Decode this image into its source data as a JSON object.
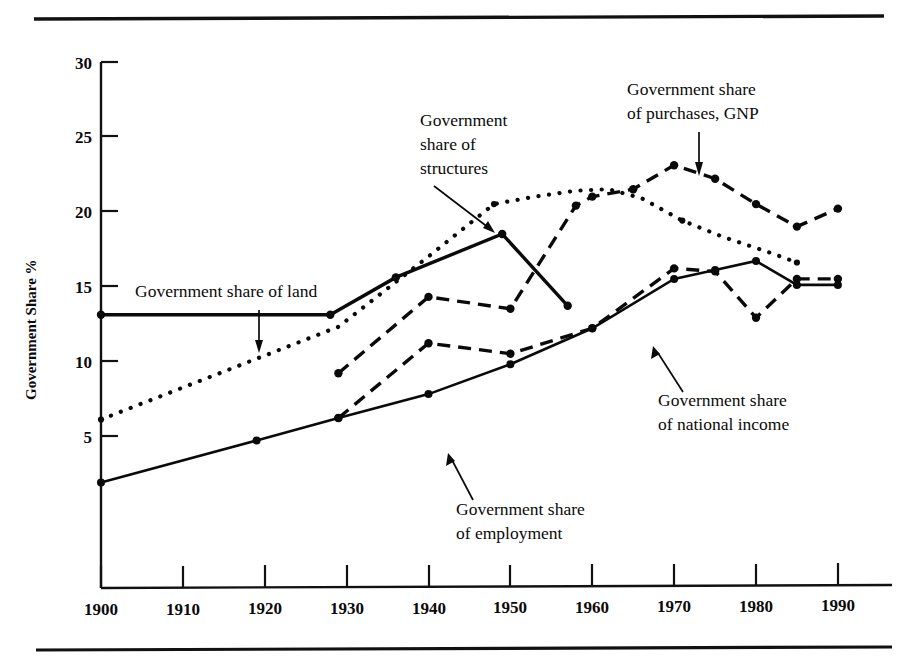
{
  "figure": {
    "top_rule": true,
    "bottom_rule": true,
    "background": "#ffffff",
    "ink": "#0a0a0a"
  },
  "chart_data": {
    "type": "line",
    "title": "",
    "xlabel": "",
    "ylabel": "Government Share %",
    "xlim": [
      1900,
      1990
    ],
    "ylim": [
      0,
      30
    ],
    "grid": false,
    "legend_position": "inline-annotations",
    "x_ticks": [
      "1900",
      "1910",
      "1920",
      "1930",
      "1940",
      "1950",
      "1960",
      "1970",
      "1980",
      "1990"
    ],
    "y_ticks": [
      "5",
      "10",
      "15",
      "20",
      "25",
      "30"
    ],
    "series": [
      {
        "name": "Government share of land",
        "style": "solid",
        "x": [
          1900,
          1928,
          1936,
          1949,
          1957
        ],
        "values": [
          13.1,
          13.1,
          15.6,
          18.5,
          13.7
        ]
      },
      {
        "name": "Government share of structures",
        "style": "dotted",
        "x": [
          1900,
          1929,
          1940,
          1948,
          1953,
          1958,
          1962,
          1966,
          1971,
          1976,
          1982,
          1985
        ],
        "values": [
          6.1,
          12.3,
          17.0,
          20.5,
          21.0,
          21.4,
          21.5,
          20.9,
          19.4,
          18.3,
          17.2,
          16.6
        ]
      },
      {
        "name": "Government share of purchases, GNP",
        "style": "dashed",
        "x": [
          1929,
          1940,
          1950,
          1958,
          1960,
          1965,
          1970,
          1975,
          1980,
          1985,
          1990
        ],
        "values": [
          9.2,
          14.3,
          13.5,
          20.4,
          21.0,
          21.5,
          23.1,
          22.2,
          20.5,
          19.0,
          20.2
        ]
      },
      {
        "name": "Government share of national income",
        "style": "dashed",
        "x": [
          1929,
          1940,
          1950,
          1960,
          1970,
          1975,
          1980,
          1985,
          1990
        ],
        "values": [
          6.2,
          11.2,
          10.5,
          12.2,
          16.2,
          16.0,
          12.9,
          15.5,
          15.5
        ]
      },
      {
        "name": "Government share of employment",
        "style": "solid",
        "x": [
          1900,
          1919,
          1929,
          1940,
          1950,
          1960,
          1970,
          1975,
          1980,
          1985,
          1990
        ],
        "values": [
          1.9,
          4.7,
          6.2,
          7.8,
          9.8,
          12.2,
          15.5,
          16.1,
          16.7,
          15.1,
          15.1
        ]
      }
    ],
    "annotations": [
      {
        "id": "land",
        "lines": [
          "Government share of land"
        ],
        "text_x": 135,
        "text_y": 297,
        "arrow": {
          "x1": 259,
          "y1": 310,
          "x2": 259,
          "y2": 350
        }
      },
      {
        "id": "structures",
        "lines": [
          "Government",
          "share of",
          "structures"
        ],
        "text_x": 420,
        "text_y": 126,
        "arrow": {
          "x1": 434,
          "y1": 178,
          "x2": 493,
          "y2": 232
        }
      },
      {
        "id": "purchases",
        "lines": [
          "Government share",
          "of purchases, GNP"
        ],
        "text_x": 627,
        "text_y": 95,
        "arrow": {
          "x1": 699,
          "y1": 132,
          "x2": 699,
          "y2": 172
        }
      },
      {
        "id": "national-income",
        "lines": [
          "Government share",
          "of national income"
        ],
        "text_x": 658,
        "text_y": 406,
        "arrow": {
          "x1": 683,
          "y1": 392,
          "x2": 654,
          "y2": 348
        }
      },
      {
        "id": "employment",
        "lines": [
          "Government share",
          "of employment"
        ],
        "text_x": 456,
        "text_y": 515,
        "arrow": {
          "x1": 473,
          "y1": 500,
          "x2": 450,
          "y2": 455
        }
      }
    ]
  }
}
